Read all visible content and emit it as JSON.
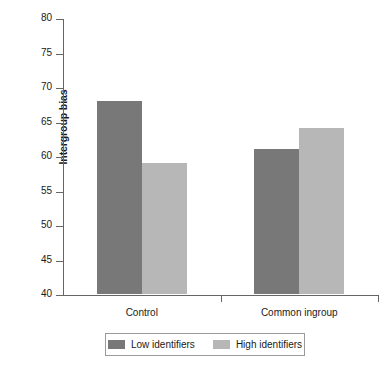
{
  "chart_data": {
    "type": "bar",
    "title": "",
    "xlabel": "",
    "ylabel": "Intergroup bias",
    "categories": [
      "Control",
      "Common ingroup"
    ],
    "series": [
      {
        "name": "Low identifiers",
        "values": [
          68,
          61
        ],
        "color": "#787878"
      },
      {
        "name": "High identifiers",
        "values": [
          59,
          64
        ],
        "color": "#b7b7b7"
      }
    ],
    "ylim": [
      40,
      80
    ],
    "yticks": [
      40,
      45,
      50,
      55,
      60,
      65,
      70,
      75,
      80
    ],
    "ytick_labels": [
      "40",
      "45",
      "50",
      "55",
      "60",
      "65",
      "70",
      "75",
      "80"
    ],
    "grid": false,
    "legend_position": "bottom"
  },
  "axis": {
    "line_color": "#666666"
  }
}
